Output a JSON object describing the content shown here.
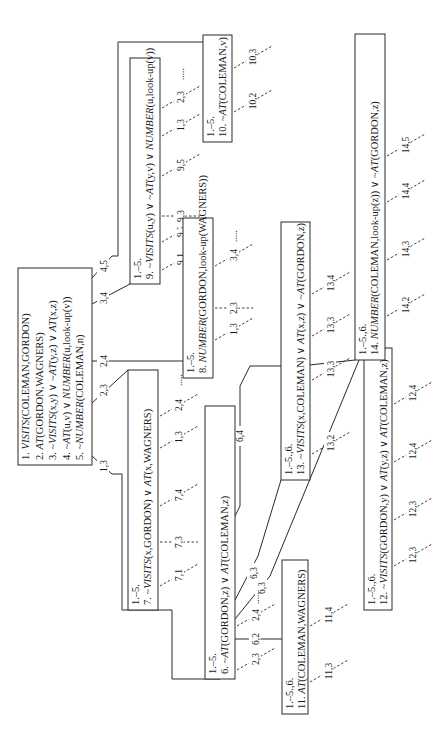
{
  "figure": {
    "orientation": "rotated-90-ccw",
    "colors": {
      "ink": "#2a2a2a",
      "background": "#ffffff"
    }
  },
  "nodes": [
    {
      "id": "n1",
      "lines": [
        [
          {
            "t": "1. "
          },
          {
            "t": "VISITS",
            "i": true
          },
          {
            "t": "(COLEMAN,GORDON)"
          }
        ],
        [
          {
            "t": "2. "
          },
          {
            "t": "AT",
            "i": true
          },
          {
            "t": "(GORDON,WAGNERS)"
          }
        ],
        [
          {
            "t": "3. ~"
          },
          {
            "t": "VISITS",
            "i": true
          },
          {
            "t": "(x,y) ∨ ~"
          },
          {
            "t": "AT",
            "i": true
          },
          {
            "t": "(y,z) ∨ "
          },
          {
            "t": "AT",
            "i": true
          },
          {
            "t": "(x,z)"
          }
        ],
        [
          {
            "t": "4. ~"
          },
          {
            "t": "AT",
            "i": true
          },
          {
            "t": "(u,v) ∨ "
          },
          {
            "t": "NUMBER",
            "i": true
          },
          {
            "t": "(u,look-up(v))"
          }
        ],
        [
          {
            "t": "5. ~"
          },
          {
            "t": "NUMBER",
            "i": true
          },
          {
            "t": "(COLEMAN,n)"
          }
        ]
      ]
    },
    {
      "id": "n9",
      "lines": [
        [
          {
            "t": "1.–5."
          }
        ],
        [
          {
            "t": "9. ~"
          },
          {
            "t": "VISITS",
            "i": true
          },
          {
            "t": "(u,y) ∨ ~"
          },
          {
            "t": "AT",
            "i": true
          },
          {
            "t": "(y,v) ∨ "
          },
          {
            "t": "NUMBER",
            "i": true
          },
          {
            "t": "(u,look-up(v))"
          }
        ]
      ]
    },
    {
      "id": "n10",
      "lines": [
        [
          {
            "t": "1.–5."
          }
        ],
        [
          {
            "t": "10. ~"
          },
          {
            "t": "AT",
            "i": true
          },
          {
            "t": "(COLEMAN,v)"
          }
        ]
      ]
    },
    {
      "id": "n8",
      "lines": [
        [
          {
            "t": "1.–5."
          }
        ],
        [
          {
            "t": "8. "
          },
          {
            "t": "NUMBER",
            "i": true
          },
          {
            "t": "(GORDON,look-up(WAGNERS))"
          }
        ]
      ]
    },
    {
      "id": "n7",
      "lines": [
        [
          {
            "t": "1.–5."
          }
        ],
        [
          {
            "t": "7. ~"
          },
          {
            "t": "VISITS",
            "i": true
          },
          {
            "t": "(x,GORDON) ∨ "
          },
          {
            "t": "AT",
            "i": true
          },
          {
            "t": "(x,WAGNERS)"
          }
        ]
      ]
    },
    {
      "id": "n6",
      "lines": [
        [
          {
            "t": "1.–5."
          }
        ],
        [
          {
            "t": "6. ~"
          },
          {
            "t": "AT",
            "i": true
          },
          {
            "t": "(GORDON,z) ∨ "
          },
          {
            "t": "AT",
            "i": true
          },
          {
            "t": "(COLEMAN,z)"
          }
        ]
      ]
    },
    {
      "id": "n11",
      "lines": [
        [
          {
            "t": "1.–5.,6."
          }
        ],
        [
          {
            "t": "11. "
          },
          {
            "t": "AT",
            "i": true
          },
          {
            "t": "(COLEMAN,WAGNERS)"
          }
        ]
      ]
    },
    {
      "id": "n13",
      "lines": [
        [
          {
            "t": "1.–5.,6."
          }
        ],
        [
          {
            "t": "13. ~"
          },
          {
            "t": "VISITS",
            "i": true
          },
          {
            "t": "(x,COLEMAN) ∨ "
          },
          {
            "t": "AT",
            "i": true
          },
          {
            "t": "(x,z) ∨ ~"
          },
          {
            "t": "AT",
            "i": true
          },
          {
            "t": "(GORDON,z)"
          }
        ]
      ]
    },
    {
      "id": "n12",
      "lines": [
        [
          {
            "t": "1.–5.,6."
          }
        ],
        [
          {
            "t": "12. ~"
          },
          {
            "t": "VISITS",
            "i": true
          },
          {
            "t": "(GORDON,y) ∨ "
          },
          {
            "t": "AT",
            "i": true
          },
          {
            "t": "(y,z) ∨ "
          },
          {
            "t": "AT",
            "i": true
          },
          {
            "t": "(COLEMAN,z)"
          }
        ]
      ]
    },
    {
      "id": "n14",
      "lines": [
        [
          {
            "t": "1.–5.,6."
          }
        ],
        [
          {
            "t": "14. "
          },
          {
            "t": "NUMBER",
            "i": true
          },
          {
            "t": "(COLEMAN,look-up(z)) ∨ ~"
          },
          {
            "t": "AT",
            "i": true
          },
          {
            "t": "(GORDON,z)"
          }
        ]
      ]
    }
  ],
  "edges": [
    {
      "from": "n1",
      "to": "n7",
      "label": "1,3"
    },
    {
      "from": "n1",
      "to": "n7",
      "label": "2,3"
    },
    {
      "from": "n1",
      "to": "n8",
      "label": "2,4"
    },
    {
      "from": "n1",
      "to": "n9",
      "label": "3,4"
    },
    {
      "from": "n1",
      "to": "n10",
      "label": "4,5"
    },
    {
      "from": "n6",
      "to": "n11",
      "label": "6,2"
    },
    {
      "from": "n6",
      "to": "n13",
      "label": "6,3"
    },
    {
      "from": "n6",
      "to": "n12",
      "label": "6,3"
    },
    {
      "from": "n6",
      "to": "n14",
      "label": "6,4"
    }
  ],
  "branches": [
    {
      "node": "n9",
      "labels": [
        "9,1",
        "9,2",
        "9,3",
        "9,5",
        "1,3",
        "2,3"
      ],
      "ellipsis": "....."
    },
    {
      "node": "n10",
      "labels": [
        "10,2",
        "10,3"
      ]
    },
    {
      "node": "n8",
      "labels": [
        "1,3",
        "2,3",
        "3,4"
      ],
      "ellipsis": "....."
    },
    {
      "node": "n7",
      "labels": [
        "7,1",
        "7,3",
        "7,4",
        "1,3",
        "2,4"
      ],
      "ellipsis": "....."
    },
    {
      "node": "n6",
      "labels": [
        "2,3",
        "2,4"
      ],
      "ellipsis": "....."
    },
    {
      "node": "n11",
      "labels": [
        "11,3",
        "11,4"
      ]
    },
    {
      "node": "n13",
      "labels": [
        "13,2",
        "13,3",
        "13,3",
        "13,4"
      ]
    },
    {
      "node": "n12",
      "labels": [
        "12,3",
        "12,3",
        "12,4",
        "12,4"
      ]
    },
    {
      "node": "n14",
      "labels": [
        "14,2",
        "14,3",
        "14,4",
        "14,5"
      ]
    }
  ]
}
